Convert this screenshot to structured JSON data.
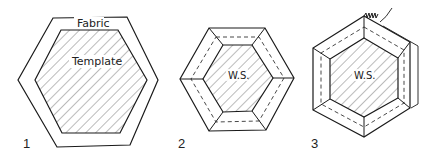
{
  "diagram": {
    "colors": {
      "stroke": "#1a1a1a",
      "hatch": "#555555",
      "background": "#ffffff"
    },
    "figures": [
      {
        "number": "1",
        "labels": {
          "fabric": "Fabric",
          "template": "Template"
        }
      },
      {
        "number": "2",
        "labels": {
          "center": "W.S."
        }
      },
      {
        "number": "3",
        "labels": {
          "center": "W.S."
        }
      }
    ]
  }
}
